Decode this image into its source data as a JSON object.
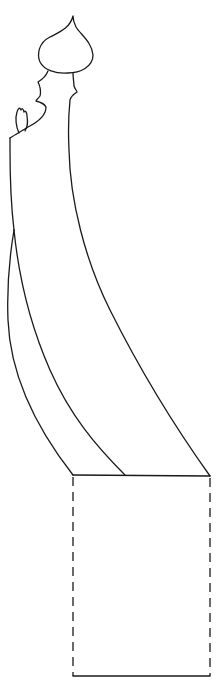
{
  "figure": {
    "stroke_color": "#1a1a1a",
    "background_color": "#ffffff",
    "parts": [
      {
        "name": "head",
        "shape": "onion-dome",
        "tip": [
          73,
          16
        ],
        "width": 56,
        "bottom_y": 73
      },
      {
        "name": "neck-and-face-profile",
        "side": "left"
      },
      {
        "name": "hand",
        "shape": "small-raised-hand",
        "position": [
          22,
          120
        ]
      },
      {
        "name": "body-panel-outer",
        "from": [
          14,
          230
        ],
        "to": [
          73,
          475
        ]
      },
      {
        "name": "body-panel-inner",
        "from": [
          14,
          230
        ],
        "to": [
          125,
          475
        ]
      },
      {
        "name": "body-back-line",
        "from": [
          69,
          110
        ],
        "to": [
          210,
          476
        ]
      },
      {
        "name": "base-box",
        "top_left": [
          73,
          475
        ],
        "bottom_right": [
          210,
          676
        ],
        "sides": "dashed",
        "top_bottom": "solid"
      }
    ]
  }
}
